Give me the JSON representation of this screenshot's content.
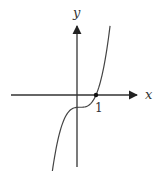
{
  "diagram": {
    "title": "",
    "x_axis_label": "x",
    "y_axis_label": "y",
    "marked_point": {
      "x": 1,
      "y": 0,
      "label": "1"
    },
    "curve": {
      "description": "Cubic curve crossing x-axis at x=1, with a flat inflection just right of the y-axis below the x-axis",
      "form": "y = a(x - h)^3 + k",
      "a": 1.18,
      "h": 0.16,
      "k": -0.7,
      "x_range": [
        -1.65,
        1.74
      ]
    }
  },
  "chart_data": {
    "type": "line",
    "title": "",
    "xlabel": "x",
    "ylabel": "y",
    "x_tick_labels": [
      "1"
    ],
    "series": [
      {
        "name": "f(x)",
        "function": "1.18*(x-0.16)^3 - 0.7",
        "x_range": [
          -1.65,
          1.74
        ]
      }
    ],
    "points": [
      {
        "x": 1,
        "y": 0,
        "label": "1"
      }
    ],
    "grid": false,
    "legend": "none"
  }
}
